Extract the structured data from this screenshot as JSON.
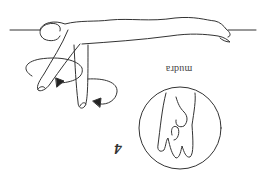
{
  "figure": {
    "orientation": "rotated 180 degrees",
    "caption_label": "mudra",
    "figure_number": "4",
    "colors": {
      "background": "#ffffff",
      "line": "#333333"
    },
    "elements": [
      "table-surface-line",
      "arm-outline",
      "hand-draped-over-edge",
      "finger-left-with-circular-arrow",
      "finger-right-with-circular-arrow",
      "mudra-inset-circle"
    ]
  }
}
